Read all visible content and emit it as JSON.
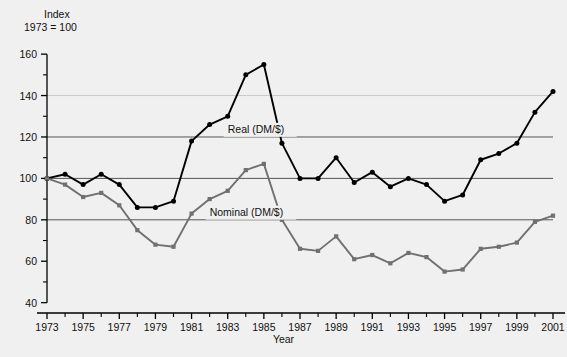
{
  "chart_data": {
    "type": "line",
    "title": "",
    "subtitle": "",
    "header_line_1": "Index",
    "header_line_2": "1973 = 100",
    "xlabel": "Year",
    "ylabel": "Index (1973 = 100)",
    "xlim": [
      1973,
      2001
    ],
    "ylim": [
      35,
      162
    ],
    "yticks": [
      40,
      60,
      80,
      100,
      120,
      140,
      160
    ],
    "ytick_labels": [
      "40",
      "60",
      "80",
      "100",
      "120",
      "140",
      "160"
    ],
    "yminor_ticks": [
      50,
      70,
      90,
      110,
      130,
      150
    ],
    "xticks": [
      1973,
      1975,
      1977,
      1979,
      1981,
      1983,
      1985,
      1987,
      1989,
      1991,
      1993,
      1995,
      1997,
      1999,
      2001
    ],
    "xtick_labels": [
      "1973",
      "1975",
      "1977",
      "1979",
      "1981",
      "1983",
      "1985",
      "1987",
      "1989",
      "1991",
      "1993",
      "1995",
      "1997",
      "1999",
      "2001"
    ],
    "xminor_ticks": [
      1974,
      1976,
      1978,
      1980,
      1982,
      1984,
      1986,
      1988,
      1990,
      1992,
      1994,
      1996,
      1998,
      2000
    ],
    "gridlines": [
      {
        "value": 140,
        "color": "#c8c8c8"
      },
      {
        "value": 120,
        "color": "#555555"
      },
      {
        "value": 100,
        "color": "#555555"
      },
      {
        "value": 80,
        "color": "#555555"
      }
    ],
    "grid": true,
    "legend_position": "inline-annotation",
    "x": [
      1973,
      1974,
      1975,
      1976,
      1977,
      1978,
      1979,
      1980,
      1981,
      1982,
      1983,
      1984,
      1985,
      1986,
      1987,
      1988,
      1989,
      1990,
      1991,
      1992,
      1993,
      1994,
      1995,
      1996,
      1997,
      1998,
      1999,
      2000,
      2001
    ],
    "series": [
      {
        "name": "Real (DM/$)",
        "color": "#000000",
        "marker": "circle",
        "label_x": 1983.0,
        "label_y": 122.0,
        "values": [
          100,
          102,
          97,
          102,
          97,
          86,
          86,
          89,
          118,
          126,
          130,
          150,
          155,
          117,
          100,
          100,
          110,
          98,
          103,
          96,
          100,
          97,
          89,
          92,
          109,
          112,
          117,
          132,
          142
        ]
      },
      {
        "name": "Nominal (DM/$)",
        "color": "#707070",
        "marker": "square",
        "label_x": 1982.0,
        "label_y": 82.0,
        "values": [
          100,
          97,
          91,
          93,
          87,
          75,
          68,
          67,
          83,
          90,
          94,
          104,
          107,
          80,
          66,
          65,
          72,
          61,
          63,
          59,
          64,
          62,
          55,
          56,
          66,
          67,
          69,
          79,
          82
        ]
      }
    ]
  },
  "colors": {
    "background": "#f0f0f0",
    "axis": "#000000",
    "real_series": "#000000",
    "nominal_series": "#707070",
    "gridline_major": "#555555",
    "gridline_light": "#c8c8c8"
  }
}
